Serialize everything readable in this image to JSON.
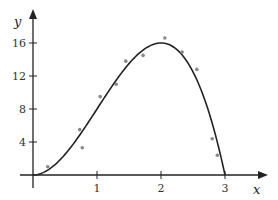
{
  "chart_data": {
    "type": "scatter",
    "title": "",
    "xlabel": "x",
    "ylabel": "y",
    "xlim": [
      0,
      3.5
    ],
    "ylim": [
      0,
      18
    ],
    "grid": false,
    "x_ticks": [
      1,
      2,
      3
    ],
    "y_ticks": [
      4,
      8,
      12,
      16
    ],
    "series": [
      {
        "name": "data points",
        "kind": "scatter",
        "x": [
          0.23,
          0.73,
          0.77,
          1.05,
          1.3,
          1.45,
          1.72,
          2.06,
          2.33,
          2.56,
          2.8,
          2.88
        ],
        "y": [
          1.0,
          5.5,
          3.3,
          9.5,
          11.0,
          13.8,
          14.5,
          16.6,
          14.9,
          12.8,
          4.4,
          2.4
        ]
      },
      {
        "name": "fitted curve",
        "kind": "line",
        "equation": "y = 4x^2(3 - x)",
        "x": [
          0,
          0.25,
          0.5,
          0.75,
          1.0,
          1.25,
          1.5,
          1.75,
          2.0,
          2.25,
          2.5,
          2.75,
          3.0
        ],
        "y": [
          0,
          0.69,
          2.5,
          5.06,
          8.0,
          10.94,
          13.5,
          15.31,
          16.0,
          15.19,
          12.5,
          7.56,
          0
        ]
      }
    ],
    "colors": {
      "curve": "#222222",
      "points": "#888888",
      "axes": "#222222"
    }
  }
}
